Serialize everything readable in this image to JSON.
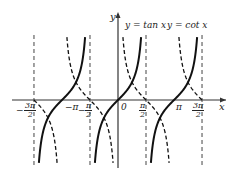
{
  "chart_data": {
    "type": "line",
    "title": "",
    "xlabel": "x",
    "ylabel": "y",
    "series": [
      {
        "name": "y = tan x",
        "style": "solid"
      },
      {
        "name": "y = cot x",
        "style": "dashed"
      }
    ],
    "legend": [
      "y = tan x",
      "y = cot x"
    ],
    "x_ticks": [
      "-3π/2",
      "-π",
      "-π/2",
      "0",
      "π/2",
      "π",
      "3π/2"
    ],
    "x_range": [
      "-3π/2",
      "3π/2"
    ],
    "asymptotes_dashed": [
      "-3π/2",
      "-π/2",
      "π/2",
      "3π/2"
    ],
    "grid": false
  },
  "labels": {
    "y_axis": "y",
    "x_axis": "x",
    "tan": "y = tan x",
    "cot": "y = cot x",
    "origin": "0",
    "neg_pi": "−π",
    "pi": "π",
    "neg3pi_num": "3π",
    "neg3pi_sign": "−",
    "negpi2_num": "π",
    "negpi2_sign": "−",
    "pi2_num": "π",
    "p3pi2_num": "3π",
    "den": "2"
  }
}
